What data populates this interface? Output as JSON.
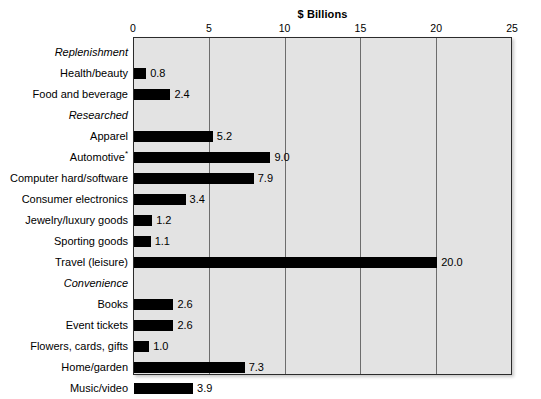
{
  "chart_data": {
    "type": "bar",
    "orientation": "horizontal",
    "title": "$ Billions",
    "xlabel": "",
    "ylabel": "",
    "xlim": [
      0,
      25
    ],
    "xticks": [
      0,
      5,
      10,
      15,
      20,
      25
    ],
    "xtick_labels": [
      "0",
      "5",
      "10",
      "15",
      "20",
      "25"
    ],
    "grid": "vertical",
    "legend": "none",
    "plot_background": "#e3e3e3",
    "bar_color": "#000000",
    "categories": [
      "Replenishment",
      "Health/beauty",
      "Food and beverage",
      "Researched",
      "Apparel",
      "Automotive*",
      "Computer hard/software",
      "Consumer electronics",
      "Jewelry/luxury goods",
      "Sporting goods",
      "Travel (leisure)",
      "Convenience",
      "Books",
      "Event tickets",
      "Flowers, cards, gifts",
      "Home/garden",
      "Music/video",
      "Toys"
    ],
    "values": [
      null,
      0.8,
      2.4,
      null,
      5.2,
      9.0,
      7.9,
      3.4,
      1.2,
      1.1,
      20.0,
      null,
      2.6,
      2.6,
      1.0,
      7.3,
      3.9,
      2.3
    ],
    "value_labels": [
      "",
      "0.8",
      "2.4",
      "",
      "5.2",
      "9.0",
      "7.9",
      "3.4",
      "1.2",
      "1.1",
      "20.0",
      "",
      "2.6",
      "2.6",
      "1.0",
      "7.3",
      "3.9",
      "2.3"
    ],
    "group_headers": [
      "Replenishment",
      "Researched",
      "Convenience"
    ],
    "rows": [
      {
        "label": "Replenishment",
        "value": null,
        "value_label": "",
        "is_group": true,
        "note": ""
      },
      {
        "label": "Health/beauty",
        "value": 0.8,
        "value_label": "0.8",
        "is_group": false,
        "note": ""
      },
      {
        "label": "Food and beverage",
        "value": 2.4,
        "value_label": "2.4",
        "is_group": false,
        "note": ""
      },
      {
        "label": "Researched",
        "value": null,
        "value_label": "",
        "is_group": true,
        "note": ""
      },
      {
        "label": "Apparel",
        "value": 5.2,
        "value_label": "5.2",
        "is_group": false,
        "note": ""
      },
      {
        "label": "Automotive",
        "value": 9.0,
        "value_label": "9.0",
        "is_group": false,
        "note": "*"
      },
      {
        "label": "Computer hard/software",
        "value": 7.9,
        "value_label": "7.9",
        "is_group": false,
        "note": ""
      },
      {
        "label": "Consumer electronics",
        "value": 3.4,
        "value_label": "3.4",
        "is_group": false,
        "note": ""
      },
      {
        "label": "Jewelry/luxury goods",
        "value": 1.2,
        "value_label": "1.2",
        "is_group": false,
        "note": ""
      },
      {
        "label": "Sporting goods",
        "value": 1.1,
        "value_label": "1.1",
        "is_group": false,
        "note": ""
      },
      {
        "label": "Travel (leisure)",
        "value": 20.0,
        "value_label": "20.0",
        "is_group": false,
        "note": ""
      },
      {
        "label": "Convenience",
        "value": null,
        "value_label": "",
        "is_group": true,
        "note": ""
      },
      {
        "label": "Books",
        "value": 2.6,
        "value_label": "2.6",
        "is_group": false,
        "note": ""
      },
      {
        "label": "Event tickets",
        "value": 2.6,
        "value_label": "2.6",
        "is_group": false,
        "note": ""
      },
      {
        "label": "Flowers, cards, gifts",
        "value": 1.0,
        "value_label": "1.0",
        "is_group": false,
        "note": ""
      },
      {
        "label": "Home/garden",
        "value": 7.3,
        "value_label": "7.3",
        "is_group": false,
        "note": ""
      },
      {
        "label": "Music/video",
        "value": 3.9,
        "value_label": "3.9",
        "is_group": false,
        "note": ""
      },
      {
        "label": "Toys",
        "value": 2.3,
        "value_label": "2.3",
        "is_group": false,
        "note": ""
      }
    ]
  }
}
